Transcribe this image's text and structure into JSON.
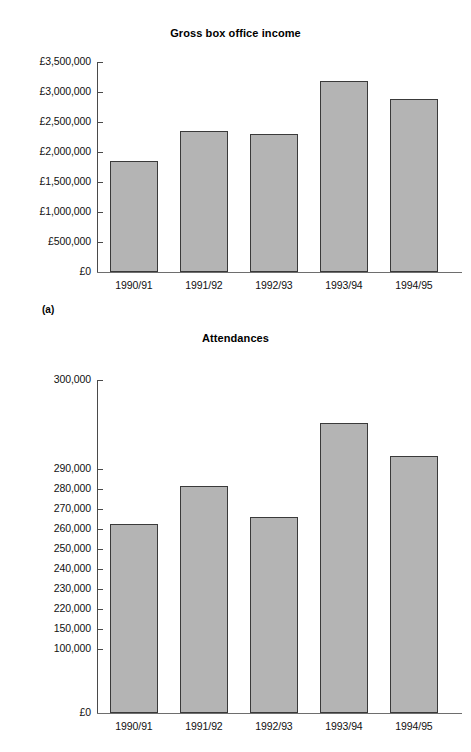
{
  "panel_label": "(a)",
  "charts": [
    {
      "id": "gross-box-office-income",
      "title": "Gross box office income",
      "y_ticks": [
        "£0",
        "£500,000",
        "£1,000,000",
        "£1,500,000",
        "£2,000,000",
        "£2,500,000",
        "£3,000,000",
        "£3,500,000"
      ],
      "categories": [
        "1990/91",
        "1991/92",
        "1992/93",
        "1993/94",
        "1994/95"
      ]
    },
    {
      "id": "attendances",
      "title": "Attendances",
      "y_ticks": [
        "£0",
        "100,000",
        "150,000",
        "220,000",
        "230,000",
        "240,000",
        "250,000",
        "260,000",
        "270,000",
        "280,000",
        "290,000",
        "300,000"
      ],
      "categories": [
        "1990/91",
        "1991/92",
        "1992/93",
        "1993/94",
        "1994/95"
      ]
    }
  ],
  "chart_data": [
    {
      "type": "bar",
      "title": "Gross box office income",
      "xlabel": "",
      "ylabel": "",
      "categories": [
        "1990/91",
        "1991/92",
        "1992/93",
        "1993/94",
        "1994/95"
      ],
      "values": [
        1850000,
        2350000,
        2290000,
        3180000,
        2890000
      ],
      "ytick_labels": [
        "£0",
        "£500,000",
        "£1,000,000",
        "£1,500,000",
        "£2,000,000",
        "£2,500,000",
        "£3,000,000",
        "£3,500,000"
      ],
      "ytick_values": [
        0,
        500000,
        1000000,
        1500000,
        2000000,
        2500000,
        3000000,
        3500000
      ],
      "ylim": [
        0,
        3500000
      ],
      "grid": false,
      "legend": null,
      "bar_fill": "#b4b4b4",
      "bar_edge": "#3a3a3a"
    },
    {
      "type": "bar",
      "title": "Attendances",
      "xlabel": "",
      "ylabel": "",
      "categories": [
        "1990/91",
        "1991/92",
        "1992/93",
        "1993/94",
        "1994/95"
      ],
      "values": [
        248000,
        267000,
        251000,
        298500,
        282000
      ],
      "ytick_labels": [
        "£0",
        "100,000",
        "150,000",
        "220,000",
        "230,000",
        "240,000",
        "250,000",
        "260,000",
        "270,000",
        "280,000",
        "290,000",
        "300,000"
      ],
      "ytick_values": [
        0,
        100000,
        150000,
        220000,
        230000,
        240000,
        250000,
        260000,
        270000,
        280000,
        290000,
        300000
      ],
      "axis_note": "broken / non-linear y-axis between 0 and 220,000",
      "ylim": [
        0,
        300000
      ],
      "grid": false,
      "legend": null,
      "bar_fill": "#b4b4b4",
      "bar_edge": "#3a3a3a"
    }
  ],
  "geometry": {
    "chart_a": {
      "axis_x": 97,
      "baseline_y": 272,
      "top_y": 62,
      "tick_y": [
        272,
        242,
        212,
        182,
        152,
        122,
        92,
        62
      ],
      "bar_left": [
        110,
        180,
        250,
        320,
        390
      ],
      "bar_width": 48,
      "bar_top": [
        161,
        131,
        134,
        81,
        99
      ]
    },
    "chart_b": {
      "axis_x": 97,
      "baseline_y": 383,
      "top_y": 50,
      "tick_y": [
        383,
        319,
        299,
        279,
        259,
        239,
        219,
        199,
        179,
        159,
        139,
        50
      ],
      "bar_left": [
        110,
        180,
        250,
        320,
        390
      ],
      "bar_width": 48,
      "bar_top": [
        194,
        156,
        187,
        93,
        126
      ]
    }
  }
}
